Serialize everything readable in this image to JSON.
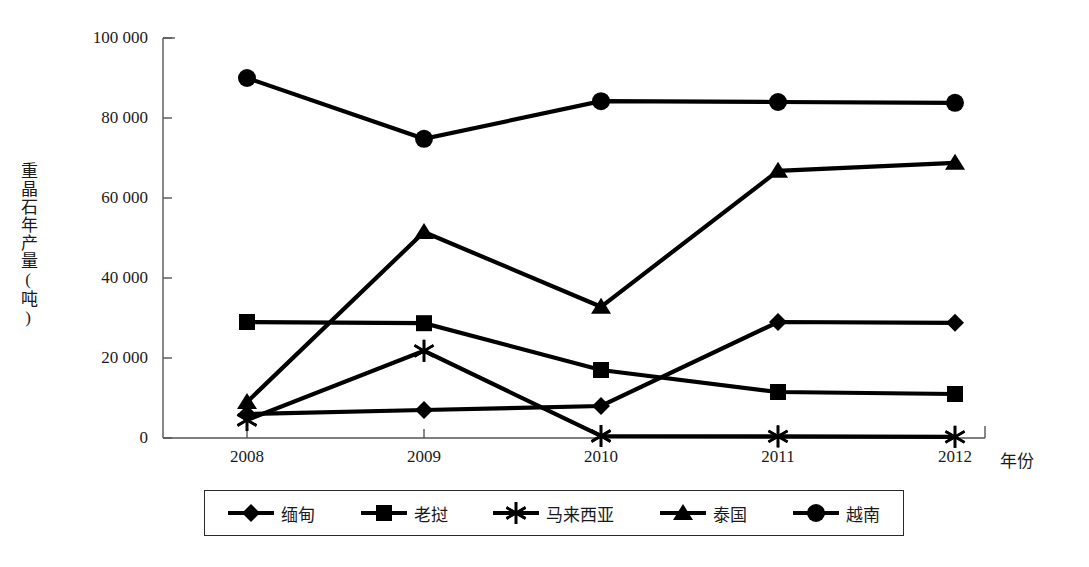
{
  "chart_data": {
    "type": "line",
    "title": "",
    "xlabel": "年份",
    "ylabel": "重晶石年产量(吨)",
    "categories": [
      "2008",
      "2009",
      "2010",
      "2011",
      "2012"
    ],
    "x_tick_labels": [
      "2008",
      "2009",
      "2010",
      "2011",
      "2012"
    ],
    "y_tick_labels": [
      "0",
      "20 000",
      "40 000",
      "60 000",
      "80 000",
      "100 000"
    ],
    "y_tick_values": [
      0,
      20000,
      40000,
      60000,
      80000,
      100000
    ],
    "ylim": [
      0,
      100000
    ],
    "grid": false,
    "legend_position": "bottom",
    "series": [
      {
        "name": "缅甸",
        "marker": "diamond",
        "color": "#000000",
        "values": [
          6000,
          7000,
          8000,
          29000,
          28800
        ]
      },
      {
        "name": "老挝",
        "marker": "square",
        "color": "#000000",
        "values": [
          29000,
          28700,
          17000,
          11500,
          11000
        ]
      },
      {
        "name": "马来西亚",
        "marker": "asterisk",
        "color": "#000000",
        "values": [
          4500,
          21800,
          500,
          400,
          300
        ]
      },
      {
        "name": "泰国",
        "marker": "triangle",
        "color": "#000000",
        "values": [
          9000,
          51500,
          32800,
          66800,
          68800
        ]
      },
      {
        "name": "越南",
        "marker": "circle",
        "color": "#000000",
        "values": [
          90000,
          74800,
          84200,
          84000,
          83800
        ]
      }
    ]
  },
  "legend": {
    "entries": [
      {
        "label": "缅甸",
        "marker": "diamond"
      },
      {
        "label": "老挝",
        "marker": "square"
      },
      {
        "label": "马来西亚",
        "marker": "asterisk"
      },
      {
        "label": "泰国",
        "marker": "triangle"
      },
      {
        "label": "越南",
        "marker": "circle"
      }
    ]
  },
  "axes": {
    "y_title": "重晶石年产量(吨)",
    "x_title": "年份"
  }
}
